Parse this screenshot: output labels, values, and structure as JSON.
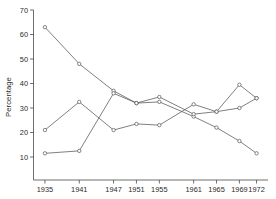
{
  "chart": {
    "type": "line",
    "title": "",
    "ylabel": "Percentage",
    "xlabel": ""
  },
  "chart_data": {
    "type": "line",
    "title": "",
    "xlabel": "",
    "ylabel": "Percentage",
    "x": [
      1935,
      1941,
      1947,
      1951,
      1955,
      1961,
      1965,
      1969,
      1972
    ],
    "xtick_labels": [
      "1935",
      "1941",
      "1947",
      "1951",
      "1955",
      "1961",
      "1965",
      "1969",
      "1972"
    ],
    "ytick_labels": [
      "10",
      "20",
      "30",
      "40",
      "50",
      "60",
      "70"
    ],
    "yticks": [
      10,
      20,
      30,
      40,
      50,
      60,
      70
    ],
    "ylim": [
      4,
      70
    ],
    "xlim": [
      1933,
      1974
    ],
    "grid": false,
    "legend": "none",
    "marker": "circle",
    "series": [
      {
        "name": "Series 1",
        "values": [
          63,
          48,
          37,
          32,
          32.5,
          26.5,
          22,
          16.5,
          11.5
        ]
      },
      {
        "name": "Series 2",
        "values": [
          11.5,
          12.5,
          36,
          32,
          34.5,
          27.5,
          28.5,
          39.5,
          34
        ]
      },
      {
        "name": "Series 3",
        "values": [
          21,
          32.5,
          21,
          23.5,
          23,
          31.5,
          28.5,
          30,
          34
        ]
      }
    ]
  }
}
